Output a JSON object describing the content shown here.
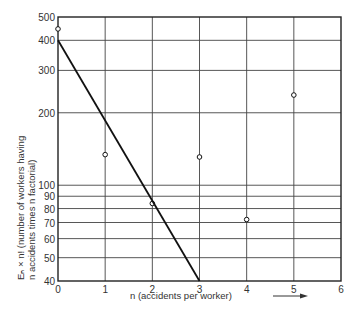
{
  "chart_data": {
    "type": "scatter",
    "title": "",
    "xlabel": "n (accidents per worker)",
    "ylabel_line1": "Eₙ × n! (number of workers having",
    "ylabel_line2": "n accidents times n factorial)",
    "xscale": "linear",
    "yscale": "log",
    "xlim": [
      0,
      6
    ],
    "ylim": [
      40,
      500
    ],
    "grid": true,
    "x_ticks": [
      0,
      1,
      2,
      3,
      4,
      5,
      6
    ],
    "y_ticks": [
      40,
      50,
      60,
      70,
      80,
      90,
      100,
      200,
      300,
      400,
      500
    ],
    "series": [
      {
        "name": "observed",
        "marker": "open-circle",
        "x": [
          0,
          1,
          2,
          3,
          4,
          5
        ],
        "y": [
          446,
          134,
          84,
          131,
          72,
          237
        ]
      },
      {
        "name": "fitted line",
        "style": "line",
        "x": [
          0,
          3
        ],
        "y": [
          400,
          40
        ]
      }
    ],
    "annotations": [
      "arrow pointing right after x-axis label"
    ]
  }
}
